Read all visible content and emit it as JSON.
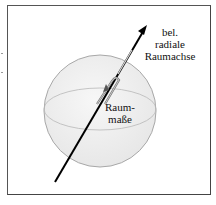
{
  "figure": {
    "axis_label_lines": [
      "bel.",
      "radiale",
      "Raumachse"
    ],
    "measure_label_lines": [
      "Raum-",
      "maße"
    ],
    "caption": "",
    "colors": {
      "sphere_fill": "#efefef",
      "sphere_stroke": "#a8a8a8",
      "equator": "#b5b5b5",
      "arrow": "#000000",
      "frame": "#555555"
    }
  }
}
